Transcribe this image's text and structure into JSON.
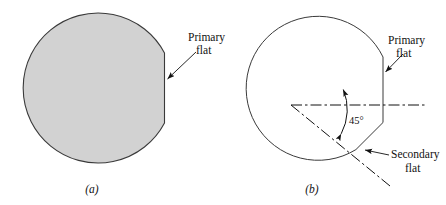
{
  "figure": {
    "background_color": "#ffffff",
    "line_color": "#111111",
    "wafer_fill_color": "#d2d2d2",
    "panels": [
      {
        "id": "a",
        "caption": "(a)",
        "filled": true,
        "annotations": [
          {
            "id": "primary-flat",
            "line1": "Primary",
            "line2": "flat"
          }
        ]
      },
      {
        "id": "b",
        "caption": "(b)",
        "filled": false,
        "angle_label": "45°",
        "annotations": [
          {
            "id": "primary-flat",
            "line1": "Primary",
            "line2": "flat"
          },
          {
            "id": "secondary-flat",
            "line1": "Secondary",
            "line2": "flat"
          }
        ]
      }
    ]
  },
  "labels": {
    "primary_flat_line1": "Primary",
    "primary_flat_line2": "flat",
    "secondary_flat_line1": "Secondary",
    "secondary_flat_line2": "flat",
    "angle": "45°",
    "caption_a": "(a)",
    "caption_b": "(b)"
  }
}
